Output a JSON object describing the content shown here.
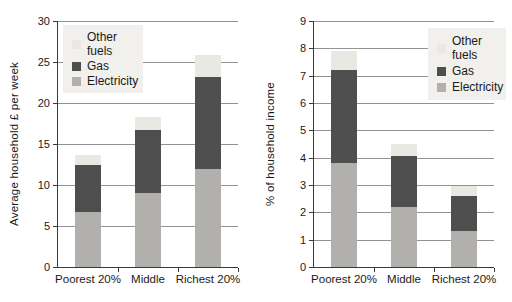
{
  "colors": {
    "electricity": "#b1b0ad",
    "gas": "#4e4e4e",
    "other_fuels": "#e9e8e2",
    "legend_bg": "#f1f0ec",
    "gridline": "#929292",
    "axis": "#3a3a3a",
    "text": "#1a1a1a",
    "background": "#ffffff"
  },
  "legend": {
    "items": [
      {
        "label": "Other fuels",
        "key": "other_fuels"
      },
      {
        "label": "Gas",
        "key": "gas"
      },
      {
        "label": "Electricity",
        "key": "electricity"
      }
    ]
  },
  "chart_data": [
    {
      "type": "bar",
      "stacked": true,
      "title": "",
      "xlabel": "",
      "ylabel": "Average household £ per week",
      "ylim": [
        0,
        30
      ],
      "ytick_step": 5,
      "grid": true,
      "legend_position": "upper-left",
      "legend": [
        "Other fuels",
        "Gas",
        "Electricity"
      ],
      "categories": [
        "Poorest 20%",
        "Middle",
        "Richest 20%"
      ],
      "series": [
        {
          "name": "Electricity",
          "values": [
            6.7,
            9.0,
            12.0
          ]
        },
        {
          "name": "Gas",
          "values": [
            5.8,
            7.7,
            11.2
          ]
        },
        {
          "name": "Other fuels",
          "values": [
            1.1,
            1.6,
            2.7
          ]
        }
      ],
      "stack_totals": [
        13.6,
        18.3,
        25.9
      ]
    },
    {
      "type": "bar",
      "stacked": true,
      "title": "",
      "xlabel": "",
      "ylabel": "% of household income",
      "ylim": [
        0,
        9
      ],
      "ytick_step": 1,
      "grid": true,
      "legend_position": "upper-right",
      "legend": [
        "Other fuels",
        "Gas",
        "Electricity"
      ],
      "categories": [
        "Poorest 20%",
        "Middle",
        "Richest 20%"
      ],
      "series": [
        {
          "name": "Electricity",
          "values": [
            3.8,
            2.2,
            1.3
          ]
        },
        {
          "name": "Gas",
          "values": [
            3.4,
            1.85,
            1.3
          ]
        },
        {
          "name": "Other fuels",
          "values": [
            0.7,
            0.45,
            0.35
          ]
        }
      ],
      "stack_totals": [
        7.9,
        4.5,
        2.95
      ]
    }
  ]
}
